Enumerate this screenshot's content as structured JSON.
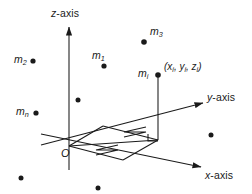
{
  "figure": {
    "type": "3d-coordinate-system-point-masses",
    "background_color": "#ffffff",
    "stroke_color": "#1a1a1a",
    "axes": {
      "z": {
        "label_prefix": "z",
        "label_suffix": "-axis",
        "label_full": "z-axis"
      },
      "y": {
        "label_prefix": "y",
        "label_suffix": "-axis",
        "label_full": "y-axis"
      },
      "x": {
        "label_prefix": "x",
        "label_suffix": "-axis",
        "label_full": "x-axis"
      }
    },
    "origin": {
      "label": "O"
    },
    "coordinate_label": {
      "open": "(",
      "x": "x",
      "x_sub": "i",
      "sep1": ", ",
      "y": "y",
      "y_sub": "i",
      "sep2": ", ",
      "z": "z",
      "z_sub": "i",
      "close": ")"
    },
    "masses": [
      {
        "name": "m",
        "sub": "2",
        "label": "m2"
      },
      {
        "name": "m",
        "sub": "1",
        "label": "m1"
      },
      {
        "name": "m",
        "sub": "3",
        "label": "m3"
      },
      {
        "name": "m",
        "sub": "n",
        "label": "mn"
      },
      {
        "name": "m",
        "sub": "i",
        "label": "mi"
      }
    ],
    "unlabeled_point_count": 5
  }
}
